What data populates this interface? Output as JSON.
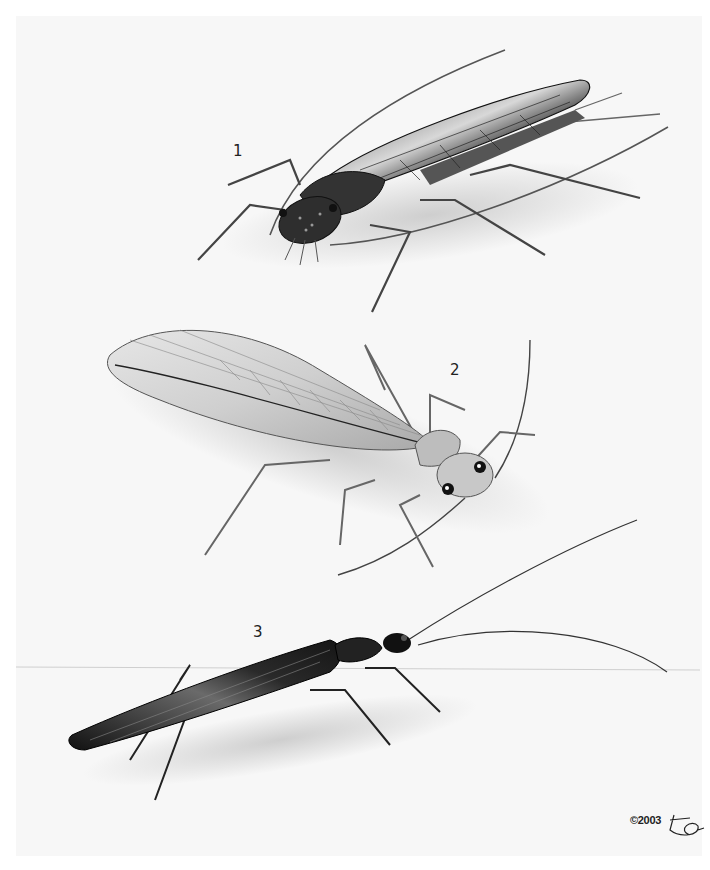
{
  "plate": {
    "background_color": "#f7f7f7",
    "border_color": "#ffffff"
  },
  "figures": [
    {
      "label": "1",
      "subject": "stonefly-dark-wings-folded"
    },
    {
      "label": "2",
      "subject": "stonefly-pale-veined-wings"
    },
    {
      "label": "3",
      "subject": "stonefly-slender-dark"
    }
  ],
  "credit": {
    "copyright": "©2003",
    "signature": "artist-signature"
  }
}
